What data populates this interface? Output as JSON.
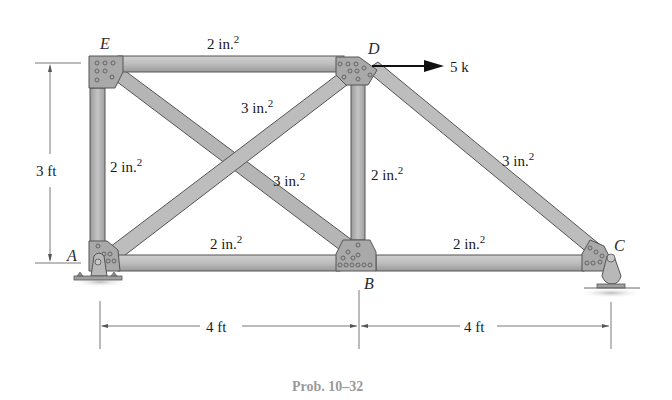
{
  "figure": {
    "caption": "Prob. 10–32",
    "nodes": {
      "A": "A",
      "B": "B",
      "C": "C",
      "D": "D",
      "E": "E"
    },
    "members": {
      "ED": "2 in.",
      "EA": "2 in.",
      "AD": "3 in.",
      "EB": "3 in.",
      "DB": "2 in.",
      "DC": "3 in.",
      "AB": "2 in.",
      "BC": "2 in."
    },
    "superscript": "2",
    "load": {
      "label": "5 k",
      "direction": "right",
      "at_node": "D"
    },
    "dimensions": {
      "height": "3 ft",
      "span_AB": "4 ft",
      "span_BC": "4 ft"
    },
    "supports": {
      "A": "pin",
      "C": "rocker"
    },
    "colors": {
      "member_fill": "#b8b8b8",
      "member_edge": "#5a5a5a",
      "gusset_fill": "#a8a8a8",
      "text": "#1a1a1a",
      "caption": "#9a9a9a",
      "dimension_line": "#555555"
    }
  }
}
